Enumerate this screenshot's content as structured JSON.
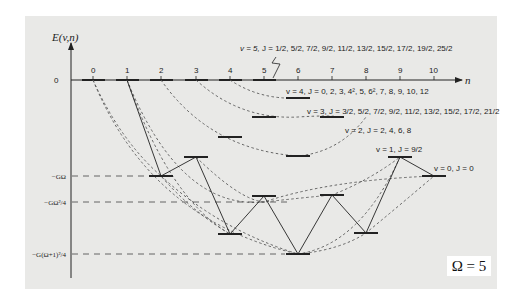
{
  "figure": {
    "y_axis_label": "E(v,n)",
    "x_axis_label": "n",
    "origin_label": "0",
    "n_ticks": [
      "0",
      "1",
      "2",
      "3",
      "4",
      "5",
      "6",
      "7",
      "8",
      "9",
      "10"
    ],
    "energy_levels_left": [
      {
        "label": "−GΩ",
        "y": 176
      },
      {
        "label": "−GΩ²/4",
        "y": 202
      },
      {
        "label": "−G(Ω+1)²/4",
        "y": 254
      }
    ],
    "omega_box": "Ω = 5",
    "band_labels": [
      {
        "v": "v = 5,",
        "J": "J = 1/2, 5/2, 7/2, 9/2, 11/2, 13/2, 15/2, 17/2, 19/2, 25/2"
      },
      {
        "v": "v = 4,",
        "J": "J = 0, 2, 3, 4², 5, 6², 7, 8, 9, 10, 12"
      },
      {
        "v": "v = 3,",
        "J": "J = 3/2, 5/2, 7/2, 9/2, 11/2, 13/2, 15/2, 17/2, 21/2"
      },
      {
        "v": "v = 2,",
        "J": "J = 2, 4, 6, 8"
      },
      {
        "v": "v = 1,",
        "J": "J = 9/2"
      },
      {
        "v": "v = 0,",
        "J": "J = 0"
      }
    ],
    "colors": {
      "panel_bg": "#e9e9e7",
      "ink": "#222222",
      "dashed_curves": "#555555"
    }
  }
}
